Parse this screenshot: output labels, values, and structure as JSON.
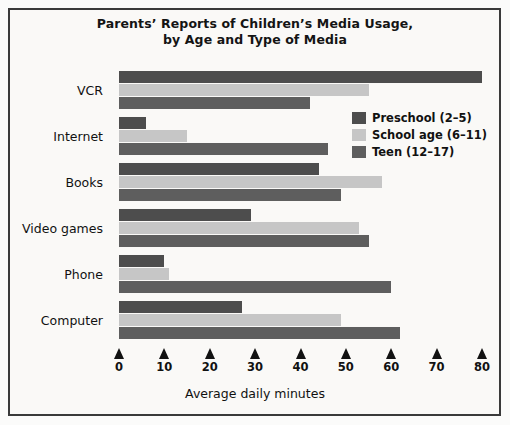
{
  "chart_data": {
    "type": "bar",
    "orientation": "horizontal",
    "title": "Parents’ Reports of Children’s Media Usage,",
    "title_line2": "by Age and Type of Media",
    "xlabel": "Average daily minutes",
    "ylabel": "",
    "xlim": [
      0,
      80
    ],
    "xticks": [
      0,
      10,
      20,
      30,
      40,
      50,
      60,
      70,
      80
    ],
    "xtick_labels": [
      "0",
      "10",
      "20",
      "30",
      "40",
      "50",
      "60",
      "70",
      "80"
    ],
    "grid": false,
    "legend_position": "upper right",
    "categories": [
      "VCR",
      "Internet",
      "Books",
      "Video games",
      "Phone",
      "Computer"
    ],
    "series": [
      {
        "name": "Preschool (2–5)",
        "color": "#4d4d4d",
        "values": [
          80,
          6,
          44,
          29,
          10,
          27
        ]
      },
      {
        "name": "School age (6–11)",
        "color": "#c6c6c6",
        "values": [
          55,
          15,
          58,
          53,
          11,
          49
        ]
      },
      {
        "name": "Teen (12–17)",
        "color": "#5e5e5e",
        "values": [
          42,
          46,
          49,
          55,
          60,
          62
        ]
      }
    ]
  },
  "title": {
    "line1": "Parents’ Reports of Children’s Media Usage,",
    "line2": "by Age and Type of Media"
  },
  "axis": {
    "xlabel": "Average daily minutes",
    "ticks": [
      "0",
      "10",
      "20",
      "30",
      "40",
      "50",
      "60",
      "70",
      "80"
    ]
  },
  "legend": {
    "entries": [
      {
        "label": "Preschool (2–5)",
        "color": "#4d4d4d"
      },
      {
        "label": "School age (6–11)",
        "color": "#c6c6c6"
      },
      {
        "label": "Teen (12–17)",
        "color": "#5e5e5e"
      }
    ]
  },
  "categories": [
    {
      "label": "VCR"
    },
    {
      "label": "Internet"
    },
    {
      "label": "Books"
    },
    {
      "label": "Video games"
    },
    {
      "label": "Phone"
    },
    {
      "label": "Computer"
    }
  ]
}
